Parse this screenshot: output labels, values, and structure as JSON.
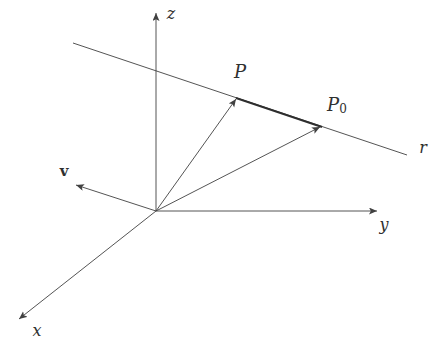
{
  "figure": {
    "kind": "vector-geometry-diagram",
    "width": 437,
    "height": 347,
    "background": "#ffffff",
    "stroke_color": "#414141",
    "segment_color": "#2e2e2e",
    "label_color": "#303030",
    "origin": [
      156,
      211
    ]
  },
  "axes": [
    {
      "name": "z-axis",
      "label": "z",
      "from": [
        156,
        211
      ],
      "to": [
        156,
        13
      ]
    },
    {
      "name": "y-axis",
      "label": "y",
      "from": [
        156,
        211
      ],
      "to": [
        377,
        211
      ]
    },
    {
      "name": "x-axis",
      "label": "x",
      "from": [
        156,
        211
      ],
      "to": [
        19,
        319
      ]
    }
  ],
  "line": {
    "name": "line-r",
    "label": "r",
    "from": [
      73,
      43
    ],
    "to": [
      407,
      155
    ]
  },
  "segment": {
    "name": "segment-P-P0",
    "from": [
      236,
      98
    ],
    "to": [
      322,
      127
    ],
    "width": 1.9
  },
  "vectors": [
    {
      "name": "vector-to-P",
      "from": [
        156,
        211
      ],
      "to": [
        236,
        99
      ]
    },
    {
      "name": "vector-to-P0",
      "from": [
        156,
        211
      ],
      "to": [
        320,
        127
      ]
    },
    {
      "name": "vector-v",
      "label": "v",
      "from": [
        156,
        211
      ],
      "to": [
        76,
        185
      ]
    }
  ],
  "points": [
    {
      "name": "point-P",
      "label": "P",
      "at": [
        236,
        99
      ]
    },
    {
      "name": "point-P0",
      "label": "P0",
      "at": [
        321,
        127
      ]
    }
  ],
  "labels": [
    {
      "name": "label-z",
      "text": "z",
      "x": 171,
      "y": 13,
      "style": "italic",
      "size": 16
    },
    {
      "name": "label-y",
      "text": "y",
      "x": 384,
      "y": 224,
      "style": "italic",
      "size": 16
    },
    {
      "name": "label-x",
      "text": "x",
      "x": 37,
      "y": 330,
      "style": "italic",
      "size": 16
    },
    {
      "name": "label-r",
      "text": "r",
      "x": 423,
      "y": 147,
      "style": "italic",
      "size": 16
    },
    {
      "name": "label-P",
      "text": "P",
      "x": 240,
      "y": 71,
      "style": "italic",
      "size": 18
    },
    {
      "name": "label-P0",
      "text": "P",
      "sub": "0",
      "x": 337,
      "y": 104,
      "style": "italic",
      "size": 18
    },
    {
      "name": "label-v",
      "text": "v",
      "x": 64,
      "y": 171,
      "style": "bold",
      "size": 15
    }
  ]
}
